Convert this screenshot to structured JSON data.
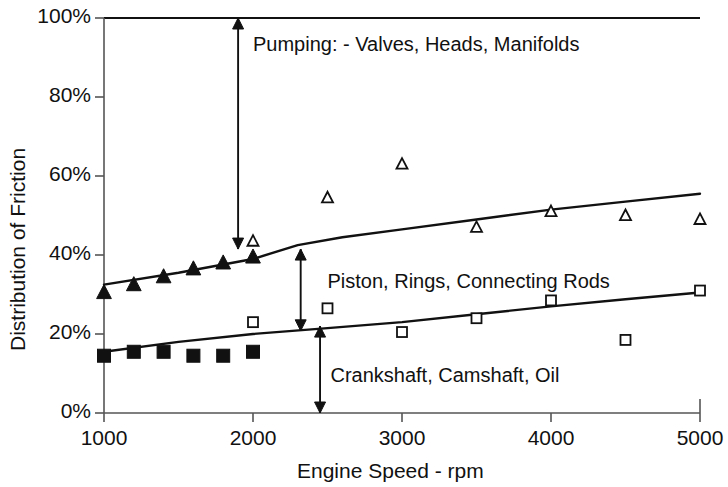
{
  "chart_data": {
    "type": "scatter",
    "title": "",
    "xlabel": "Engine Speed - rpm",
    "ylabel": "Distribution of Friction",
    "xlim": [
      1000,
      5000
    ],
    "ylim": [
      0,
      100
    ],
    "xticks": [
      1000,
      2000,
      3000,
      4000,
      5000
    ],
    "xtick_labels": [
      "1000",
      "2000",
      "3000",
      "4000",
      "5000"
    ],
    "yticks": [
      0,
      20,
      40,
      60,
      80,
      100
    ],
    "ytick_labels": [
      "0%",
      "20%",
      "40%",
      "60%",
      "80%",
      "100%"
    ],
    "grid": false,
    "legend_position": "none",
    "series": [
      {
        "name": "Cumulative crankshaft + piston (upper boundary)",
        "marker": "triangle-filled",
        "x": [
          1000,
          1200,
          1400,
          1600,
          1800,
          2000
        ],
        "y": [
          30.5,
          32.5,
          34.5,
          36.5,
          38.0,
          39.5
        ]
      },
      {
        "name": "Cumulative crankshaft + piston (upper boundary) - open",
        "marker": "triangle-open",
        "x": [
          2000,
          2500,
          3000,
          3500,
          4000,
          4500,
          5000
        ],
        "y": [
          43.5,
          54.5,
          63.0,
          47.0,
          51.0,
          50.0,
          49.0
        ]
      },
      {
        "name": "Crankshaft, Camshaft, Oil (lower boundary)",
        "marker": "square-filled",
        "x": [
          1000,
          1200,
          1400,
          1600,
          1800,
          2000
        ],
        "y": [
          14.5,
          15.5,
          15.5,
          14.5,
          14.5,
          15.5
        ]
      },
      {
        "name": "Crankshaft, Camshaft, Oil (lower boundary) - open",
        "marker": "square-open",
        "x": [
          2000,
          2500,
          3000,
          3500,
          4000,
          4500,
          5000
        ],
        "y": [
          23.0,
          26.5,
          20.5,
          24.0,
          28.5,
          18.5,
          31.0
        ]
      }
    ],
    "trend_lines": [
      {
        "name": "upper-boundary-curve",
        "comment": "boundary between Piston/Rings/Connecting Rods and Pumping",
        "points": [
          [
            1000,
            32.5
          ],
          [
            1500,
            35.5
          ],
          [
            2000,
            39.0
          ],
          [
            2300,
            42.5
          ],
          [
            2600,
            44.5
          ],
          [
            3000,
            46.5
          ],
          [
            3500,
            49.0
          ],
          [
            4000,
            51.5
          ],
          [
            4500,
            53.5
          ],
          [
            5000,
            55.5
          ]
        ]
      },
      {
        "name": "lower-boundary-curve",
        "comment": "boundary between Crankshaft/Camshaft/Oil and Piston/Rings/Connecting Rods",
        "points": [
          [
            1000,
            15.5
          ],
          [
            1500,
            18.0
          ],
          [
            2000,
            20.0
          ],
          [
            2500,
            21.5
          ],
          [
            3000,
            23.0
          ],
          [
            3500,
            25.0
          ],
          [
            4000,
            27.0
          ],
          [
            4500,
            28.8
          ],
          [
            5000,
            30.5
          ]
        ]
      }
    ],
    "annotations": [
      {
        "name": "pumping-arrow",
        "type": "double-arrow-vertical",
        "x": 1900,
        "y_from": 100,
        "y_to": 41.5
      },
      {
        "name": "piston-arrow",
        "type": "double-arrow-vertical",
        "x": 2320,
        "y_from": 41.5,
        "y_to": 20.8
      },
      {
        "name": "crankshaft-arrow",
        "type": "double-arrow-vertical",
        "x": 2450,
        "y_from": 22.0,
        "y_to": 0
      }
    ],
    "region_labels": [
      {
        "name": "pumping-label",
        "text": "Pumping:  - Valves, Heads, Manifolds",
        "x": 2000,
        "y": 93
      },
      {
        "name": "piston-label",
        "text": "Piston, Rings, Connecting Rods",
        "x": 2500,
        "y": 33
      },
      {
        "name": "crankshaft-label",
        "text": "Crankshaft, Camshaft, Oil",
        "x": 2520,
        "y": 9
      }
    ],
    "colors": {
      "line": "#111111",
      "marker": "#111111",
      "axis": "#555555",
      "text": "#111111",
      "background": "#ffffff"
    }
  }
}
